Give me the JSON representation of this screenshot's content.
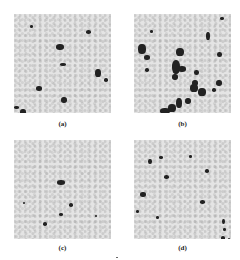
{
  "figure": {
    "panels": [
      {
        "id": "a",
        "label": "(a)",
        "description": "sparse dark clusters on light gray background",
        "blobs": [
          [
            56,
            44,
            8,
            6
          ],
          [
            36,
            86,
            6,
            5
          ],
          [
            61,
            97,
            6,
            6
          ],
          [
            95,
            69,
            6,
            8
          ],
          [
            104,
            78,
            4,
            4
          ],
          [
            20,
            109,
            6,
            6
          ],
          [
            14,
            106,
            5,
            3
          ],
          [
            86,
            30,
            5,
            4
          ],
          [
            60,
            63,
            6,
            3
          ],
          [
            30,
            25,
            3,
            3
          ]
        ]
      },
      {
        "id": "b",
        "label": "(b)",
        "description": "dense, extended dark aggregates",
        "blobs": [
          [
            138,
            44,
            8,
            10
          ],
          [
            144,
            55,
            6,
            5
          ],
          [
            176,
            48,
            8,
            8
          ],
          [
            172,
            60,
            8,
            14
          ],
          [
            178,
            66,
            8,
            6
          ],
          [
            172,
            74,
            6,
            6
          ],
          [
            192,
            80,
            6,
            6
          ],
          [
            194,
            70,
            5,
            5
          ],
          [
            190,
            84,
            8,
            8
          ],
          [
            198,
            88,
            8,
            8
          ],
          [
            176,
            98,
            6,
            10
          ],
          [
            168,
            104,
            8,
            8
          ],
          [
            160,
            108,
            10,
            6
          ],
          [
            160,
            118,
            8,
            5
          ],
          [
            185,
            98,
            6,
            6
          ],
          [
            206,
            32,
            4,
            8
          ],
          [
            217,
            52,
            5,
            5
          ],
          [
            216,
            80,
            6,
            6
          ],
          [
            212,
            88,
            4,
            4
          ],
          [
            145,
            68,
            4,
            4
          ],
          [
            150,
            30,
            3,
            3
          ],
          [
            220,
            17,
            4,
            3
          ]
        ]
      },
      {
        "id": "c",
        "label": "(c)",
        "description": "few small isolated dark spots",
        "blobs": [
          [
            57,
            40,
            8,
            5
          ],
          [
            69,
            63,
            4,
            4
          ],
          [
            59,
            73,
            4,
            3
          ],
          [
            43,
            82,
            4,
            4
          ],
          [
            23,
            62,
            2,
            2
          ],
          [
            95,
            75,
            2,
            2
          ]
        ]
      },
      {
        "id": "d",
        "label": "(d)",
        "description": "scattered small dark spots",
        "blobs": [
          [
            148,
            19,
            4,
            5
          ],
          [
            159,
            16,
            4,
            3
          ],
          [
            189,
            15,
            3,
            3
          ],
          [
            164,
            35,
            5,
            4
          ],
          [
            205,
            29,
            4,
            4
          ],
          [
            140,
            52,
            6,
            5
          ],
          [
            200,
            60,
            5,
            4
          ],
          [
            222,
            79,
            3,
            5
          ],
          [
            223,
            88,
            3,
            3
          ],
          [
            221,
            96,
            4,
            4
          ],
          [
            228,
            98,
            2,
            3
          ],
          [
            156,
            76,
            3,
            3
          ],
          [
            136,
            70,
            3,
            3
          ]
        ]
      }
    ]
  }
}
